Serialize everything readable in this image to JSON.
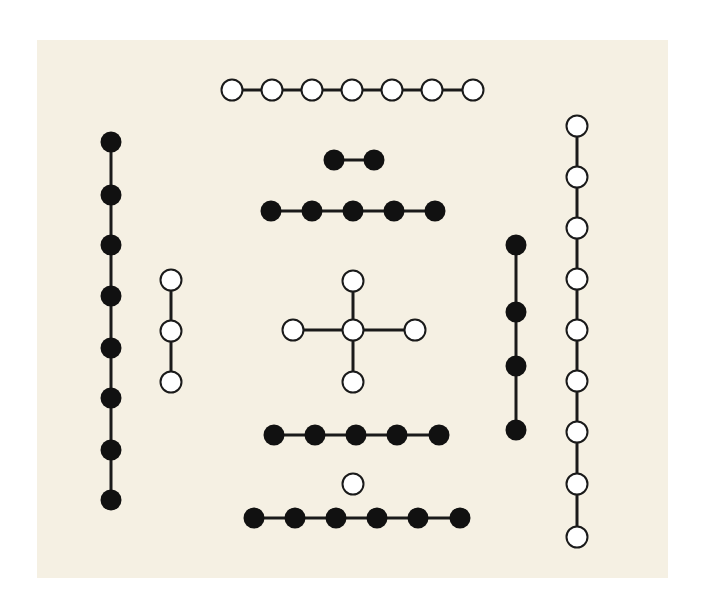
{
  "diagram": {
    "background": "#f5f0e3",
    "colors": {
      "black_dot": "#111111",
      "white_dot_fill": "#ffffff",
      "stroke": "#1a1a1a"
    },
    "dot_radius": 10.5,
    "groups": [
      {
        "name": "top-white-7",
        "count": 7,
        "kind": "white",
        "orientation": "horizontal",
        "points": [
          [
            232,
            90
          ],
          [
            272,
            90
          ],
          [
            312,
            90
          ],
          [
            352,
            90
          ],
          [
            392,
            90
          ],
          [
            432,
            90
          ],
          [
            473,
            90
          ]
        ]
      },
      {
        "name": "top-black-2",
        "count": 2,
        "kind": "black",
        "orientation": "horizontal",
        "points": [
          [
            334,
            160
          ],
          [
            374,
            160
          ]
        ]
      },
      {
        "name": "upper-black-5",
        "count": 5,
        "kind": "black",
        "orientation": "horizontal",
        "points": [
          [
            271,
            211
          ],
          [
            312,
            211
          ],
          [
            353,
            211
          ],
          [
            394,
            211
          ],
          [
            435,
            211
          ]
        ]
      },
      {
        "name": "center-white-5-cross",
        "count": 5,
        "kind": "white",
        "orientation": "cross",
        "points": [
          [
            353,
            330
          ],
          [
            353,
            281
          ],
          [
            353,
            382
          ],
          [
            293,
            330
          ],
          [
            415,
            330
          ]
        ],
        "edges": [
          [
            0,
            1
          ],
          [
            0,
            2
          ],
          [
            0,
            3
          ],
          [
            0,
            4
          ]
        ]
      },
      {
        "name": "lower-black-5",
        "count": 5,
        "kind": "black",
        "orientation": "horizontal",
        "points": [
          [
            274,
            435
          ],
          [
            315,
            435
          ],
          [
            356,
            435
          ],
          [
            397,
            435
          ],
          [
            439,
            435
          ]
        ]
      },
      {
        "name": "bottom-white-1",
        "count": 1,
        "kind": "white",
        "orientation": "single",
        "points": [
          [
            353,
            484
          ]
        ]
      },
      {
        "name": "bottom-black-6",
        "count": 6,
        "kind": "black",
        "orientation": "horizontal",
        "points": [
          [
            254,
            518
          ],
          [
            295,
            518
          ],
          [
            336,
            518
          ],
          [
            377,
            518
          ],
          [
            418,
            518
          ],
          [
            460,
            518
          ]
        ]
      },
      {
        "name": "left-black-8",
        "count": 8,
        "kind": "black",
        "orientation": "vertical",
        "points": [
          [
            111,
            142
          ],
          [
            111,
            195
          ],
          [
            111,
            245
          ],
          [
            111,
            296
          ],
          [
            111,
            348
          ],
          [
            111,
            398
          ],
          [
            111,
            450
          ],
          [
            111,
            500
          ]
        ]
      },
      {
        "name": "left-white-3",
        "count": 3,
        "kind": "white",
        "orientation": "vertical",
        "points": [
          [
            171,
            280
          ],
          [
            171,
            331
          ],
          [
            171,
            382
          ]
        ]
      },
      {
        "name": "right-black-4",
        "count": 4,
        "kind": "black",
        "orientation": "vertical",
        "points": [
          [
            516,
            245
          ],
          [
            516,
            312
          ],
          [
            516,
            366
          ],
          [
            516,
            430
          ]
        ]
      },
      {
        "name": "right-white-9",
        "count": 9,
        "kind": "white",
        "orientation": "vertical",
        "points": [
          [
            577,
            126
          ],
          [
            577,
            177
          ],
          [
            577,
            228
          ],
          [
            577,
            279
          ],
          [
            577,
            330
          ],
          [
            577,
            381
          ],
          [
            577,
            432
          ],
          [
            577,
            484
          ],
          [
            577,
            537
          ]
        ]
      }
    ]
  }
}
